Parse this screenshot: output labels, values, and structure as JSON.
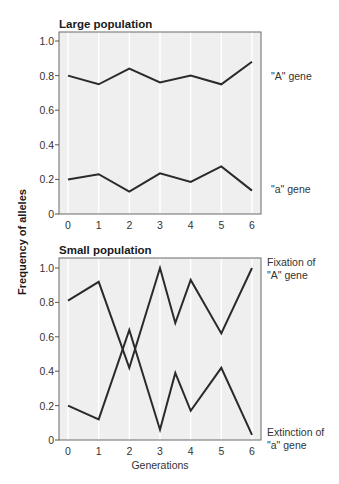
{
  "y_axis_label": "Frequency of alleles",
  "x_axis_label": "Generations",
  "panels": [
    {
      "title": "Large population",
      "series_labels": [
        "\"A\" gene",
        "\"a\" gene"
      ]
    },
    {
      "title": "Small population",
      "series_labels": [
        "Fixation of",
        "\"A\" gene",
        "Extinction of",
        "\"a\" gene"
      ]
    }
  ],
  "colors": {
    "plot_bg": "#efefef",
    "gridline": "#ffffff",
    "line": "#2a2a2a",
    "frame": "#555555"
  },
  "chart_data": [
    {
      "type": "line",
      "title": "Large population",
      "xlabel": "Generations",
      "ylabel": "Frequency of alleles",
      "xlim": [
        0,
        6
      ],
      "ylim": [
        0,
        1.0
      ],
      "xticks": [
        0,
        1,
        2,
        3,
        4,
        5,
        6
      ],
      "yticks": [
        0,
        0.2,
        0.4,
        0.6,
        0.8,
        1.0
      ],
      "ytick_labels": [
        "0",
        "0.2",
        "0.4",
        "0.6",
        "0.8",
        "1.0"
      ],
      "grid": "vertical",
      "series": [
        {
          "name": "\"A\" gene",
          "x": [
            0,
            1,
            2,
            3,
            4,
            5,
            6
          ],
          "values": [
            0.8,
            0.75,
            0.84,
            0.76,
            0.8,
            0.75,
            0.88
          ]
        },
        {
          "name": "\"a\" gene",
          "x": [
            0,
            1,
            2,
            3,
            4,
            5,
            6
          ],
          "values": [
            0.2,
            0.23,
            0.13,
            0.235,
            0.185,
            0.275,
            0.135
          ]
        }
      ]
    },
    {
      "type": "line",
      "title": "Small population",
      "xlabel": "Generations",
      "ylabel": "Frequency of alleles",
      "xlim": [
        0,
        6
      ],
      "ylim": [
        0,
        1.0
      ],
      "xticks": [
        0,
        1,
        2,
        3,
        4,
        5,
        6
      ],
      "yticks": [
        0,
        0.2,
        0.4,
        0.6,
        0.8,
        1.0
      ],
      "ytick_labels": [
        "0",
        "0.2",
        "0.4",
        "0.6",
        "0.8",
        "1.0"
      ],
      "grid": "vertical",
      "series": [
        {
          "name": "Fixation of \"A\" gene",
          "x": [
            0,
            1,
            2,
            3,
            3.5,
            4,
            5,
            6
          ],
          "values": [
            0.81,
            0.92,
            0.42,
            1.0,
            0.68,
            0.93,
            0.62,
            1.0
          ]
        },
        {
          "name": "Extinction of \"a\" gene",
          "x": [
            0,
            1,
            2,
            3,
            3.5,
            4,
            5,
            6
          ],
          "values": [
            0.2,
            0.12,
            0.64,
            0.06,
            0.39,
            0.17,
            0.42,
            0.03
          ]
        }
      ]
    }
  ]
}
